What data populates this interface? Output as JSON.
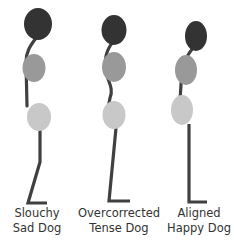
{
  "colors": {
    "head": "#333333",
    "chest": "#999999",
    "hips": "#c8c8c8",
    "spine": "#404040",
    "background": "#ffffff",
    "text": "#333333"
  },
  "figures": [
    {
      "name": "slouchy",
      "label_line1": "Slouchy",
      "label_line2": "Sad Dog",
      "posture": "slouched"
    },
    {
      "name": "overcorrected",
      "label_line1": "Overcorrected",
      "label_line2": "Tense Dog",
      "posture": "overcorrected"
    },
    {
      "name": "aligned",
      "label_line1": "Aligned",
      "label_line2": "Happy Dog",
      "posture": "aligned"
    }
  ]
}
